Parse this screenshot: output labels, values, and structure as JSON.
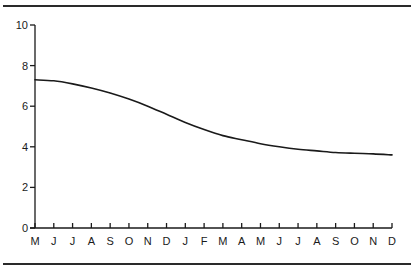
{
  "chart_data": {
    "type": "line",
    "title": "",
    "xlabel": "",
    "ylabel": "",
    "categories": [
      "M",
      "J",
      "J",
      "A",
      "S",
      "O",
      "N",
      "D",
      "J",
      "F",
      "M",
      "A",
      "M",
      "J",
      "J",
      "A",
      "S",
      "O",
      "N",
      "D"
    ],
    "series": [
      {
        "name": "series-1",
        "values": [
          7.3,
          7.25,
          7.1,
          6.9,
          6.65,
          6.35,
          6.0,
          5.6,
          5.2,
          4.85,
          4.55,
          4.35,
          4.15,
          4.0,
          3.88,
          3.8,
          3.72,
          3.68,
          3.65,
          3.6
        ]
      }
    ],
    "yticks": [
      0,
      2,
      4,
      6,
      8,
      10
    ],
    "ylim": [
      0,
      10
    ],
    "grid": false,
    "legend": "none",
    "line_color": "#1a1a1a"
  }
}
